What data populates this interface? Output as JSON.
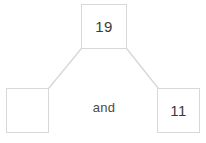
{
  "diagram": {
    "kind": "number-bond",
    "conjunction_label": "and",
    "whole": {
      "label": "19",
      "value": 19,
      "filled": true
    },
    "parts": [
      {
        "label": "",
        "value": null,
        "filled": false,
        "position": "left"
      },
      {
        "label": "11",
        "value": 11,
        "filled": true,
        "position": "right"
      }
    ],
    "connectors": [
      {
        "name": "whole-to-left-part",
        "from": "whole",
        "to": "part-left"
      },
      {
        "name": "whole-to-right-part",
        "from": "whole",
        "to": "part-right"
      }
    ]
  },
  "colors": {
    "background": "#ffffff",
    "box_border": "#d8d8d8",
    "connector_line": "#d8d8d8",
    "number_text": "#3b3b3b",
    "conjunction_text": "#4a4a4a"
  }
}
